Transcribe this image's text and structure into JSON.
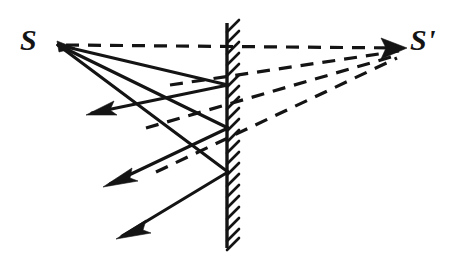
{
  "figure": {
    "kind": "optics-ray-diagram",
    "background_color": "#ffffff",
    "ink_color": "#141414",
    "width": 454,
    "height": 259
  },
  "labels": {
    "source": "S",
    "image": "S'"
  },
  "points": {
    "source": {
      "name": "S",
      "x": 58,
      "y": 45
    },
    "image": {
      "name": "S'",
      "x": 408,
      "y": 48
    },
    "mirror_hits": [
      {
        "name": "P0",
        "x": 227,
        "y": 45
      },
      {
        "name": "P1",
        "x": 227,
        "y": 85
      },
      {
        "name": "P2",
        "x": 227,
        "y": 128
      },
      {
        "name": "P3",
        "x": 227,
        "y": 172
      }
    ]
  },
  "mirror": {
    "name": "plane-mirror",
    "x": 227,
    "y_top": 23,
    "y_bottom": 248,
    "hatch_side": "right",
    "hatch_angle_deg": 45,
    "hatch_spacing": 11,
    "hatch_length": 13
  },
  "incident_rays": [
    {
      "name": "incident-ray-1",
      "from": [
        58,
        45
      ],
      "to": [
        227,
        85
      ]
    },
    {
      "name": "incident-ray-2",
      "from": [
        58,
        45
      ],
      "to": [
        227,
        128
      ]
    },
    {
      "name": "incident-ray-3",
      "from": [
        58,
        45
      ],
      "to": [
        227,
        172
      ]
    }
  ],
  "reflected_rays": [
    {
      "name": "reflected-ray-1",
      "from": [
        227,
        85
      ],
      "to": [
        86,
        114
      ],
      "arrow": "left"
    },
    {
      "name": "reflected-ray-2",
      "from": [
        227,
        128
      ],
      "to": [
        104,
        186
      ],
      "arrow": "left"
    },
    {
      "name": "reflected-ray-3",
      "from": [
        227,
        172
      ],
      "to": [
        116,
        238
      ],
      "arrow": "left"
    }
  ],
  "virtual_rays": [
    {
      "name": "virtual-ray-axis",
      "from": [
        58,
        45
      ],
      "to": [
        408,
        48
      ],
      "style": "dashed",
      "note": "optical axis through S and S'"
    },
    {
      "name": "virtual-ray-1",
      "from": [
        170,
        85
      ],
      "to": [
        408,
        48
      ],
      "style": "dashed"
    },
    {
      "name": "virtual-ray-2",
      "from": [
        146,
        128
      ],
      "to": [
        408,
        48
      ],
      "style": "dashed"
    },
    {
      "name": "virtual-ray-3",
      "from": [
        156,
        172
      ],
      "to": [
        408,
        48
      ],
      "style": "dashed"
    }
  ],
  "arrowheads": [
    {
      "name": "arrowhead-image",
      "at": [
        405,
        48
      ],
      "direction": "right"
    },
    {
      "name": "arrowhead-reflected-1",
      "at": [
        86,
        114
      ],
      "direction": "down-left"
    },
    {
      "name": "arrowhead-reflected-2",
      "at": [
        104,
        186
      ],
      "direction": "down-left"
    },
    {
      "name": "arrowhead-reflected-3",
      "at": [
        116,
        238
      ],
      "direction": "down-left"
    }
  ]
}
